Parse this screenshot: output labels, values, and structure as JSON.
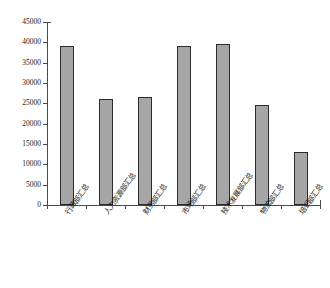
{
  "chart_data": {
    "type": "bar",
    "title": "",
    "subtitle": "",
    "xlabel": "",
    "ylabel": "",
    "categories": [
      "行政部汇总",
      "人力资源部汇总",
      "财务部汇总",
      "市场部汇总",
      "技术发展部汇总",
      "物流部汇总",
      "培训部汇总"
    ],
    "values": [
      39100,
      26100,
      26600,
      39100,
      39600,
      24600,
      13000
    ],
    "ylim": [
      0,
      45000
    ],
    "ytick_step": 5000,
    "ytick_labels": [
      "45000",
      "40000",
      "35000",
      "30000",
      "25000",
      "20000",
      "15000",
      "10000",
      "5000",
      "0"
    ],
    "ytick_values": [
      45000,
      40000,
      35000,
      30000,
      25000,
      20000,
      15000,
      10000,
      5000,
      0
    ],
    "grid": false,
    "legend": false,
    "legend_position": "none",
    "bar_color": "#a6a6a6",
    "bar_border_color": "#2b2b2b",
    "axis_color": "#4a4a4a",
    "background_color": "#ffffff",
    "series": [
      {
        "name": "汇总",
        "values": [
          39100,
          26100,
          26600,
          39100,
          39600,
          24600,
          13000
        ]
      }
    ]
  }
}
